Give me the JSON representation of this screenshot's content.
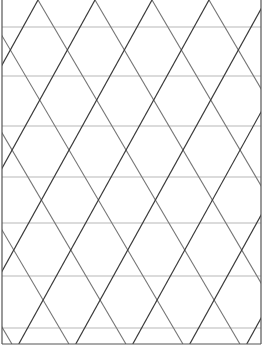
{
  "pattern": {
    "width": 264,
    "height": 356,
    "background": "#ffffff",
    "frame": {
      "left": 2,
      "right": 261,
      "top": 0,
      "bottom": 344,
      "color": "#555555",
      "width": 1.2
    },
    "horizontal_lines": {
      "y": [
        27,
        76,
        126,
        177,
        223,
        276,
        328
      ],
      "color": "#cfcfcf",
      "width": 1.4
    },
    "diagonal_dark": {
      "direction": "up-right",
      "dx_per_dy": -0.553,
      "x_at_y0_start": 38,
      "spacing": 57,
      "color": "#3a3a3a",
      "width": 1.2
    },
    "diagonal_light": {
      "direction": "down-right",
      "dx_per_dy": 0.587,
      "x_at_y0_start": 38,
      "spacing": 57,
      "color": "#757575",
      "width": 1.1
    }
  }
}
